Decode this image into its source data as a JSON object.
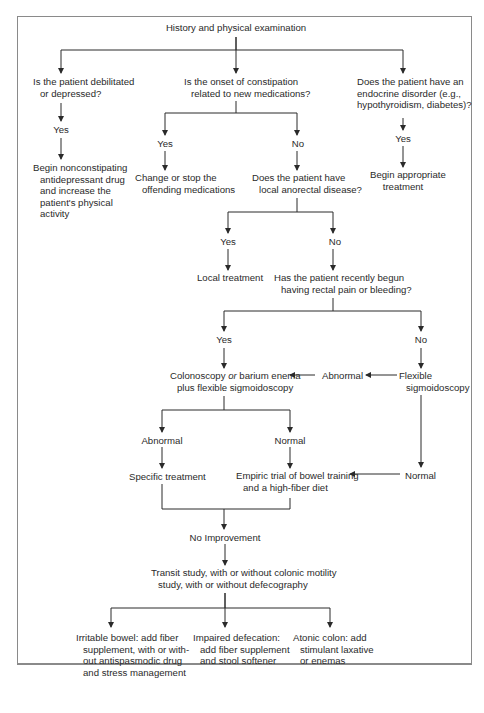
{
  "diagram": {
    "nodes": {
      "root": [
        "History and physical examination"
      ],
      "q_debilitated": [
        "Is the patient debilitated",
        "or depressed?"
      ],
      "yes_debilitated": [
        "Yes"
      ],
      "a_debilitated": [
        "Begin nonconstipating",
        "antidepressant drug",
        "and increase the",
        "patient's physical",
        "activity"
      ],
      "q_medications": [
        "Is the onset of constipation",
        "related to new medications?"
      ],
      "yes_medications": [
        "Yes"
      ],
      "no_medications": [
        "No"
      ],
      "a_medications": [
        "Change or stop the",
        "offending medications"
      ],
      "q_endocrine": [
        "Does the patient have an",
        "endocrine disorder (e.g.,",
        "hypothyroidism, diabetes)?"
      ],
      "yes_endocrine": [
        "Yes"
      ],
      "a_endocrine": [
        "Begin appropriate",
        "treatment"
      ],
      "q_anorectal": [
        "Does the patient have",
        "local anorectal disease?"
      ],
      "yes_anorectal": [
        "Yes"
      ],
      "no_anorectal": [
        "No"
      ],
      "a_anorectal": [
        "Local treatment"
      ],
      "q_rectal": [
        "Has the patient recently begun",
        "having rectal pain or bleeding?"
      ],
      "yes_rectal": [
        "Yes"
      ],
      "no_rectal": [
        "No"
      ],
      "colonoscopy": [
        "Colonoscopy or barium enema",
        "plus flexible sigmoidoscopy"
      ],
      "abnormal_flex": [
        "Abnormal"
      ],
      "flex_sig": [
        "Flexible",
        "sigmoidoscopy"
      ],
      "abnormal_colo": [
        "Abnormal"
      ],
      "normal_colo": [
        "Normal"
      ],
      "specific_tx": [
        "Specific treatment"
      ],
      "empiric": [
        "Empiric trial of bowel training",
        "and a high-fiber diet"
      ],
      "normal_flex": [
        "Normal"
      ],
      "no_improvement": [
        "No Improvement"
      ],
      "transit": [
        "Transit study, with or without colonic motility",
        "study, with or without defecography"
      ],
      "ibs": [
        "Irritable bowel: add fiber",
        "supplement, with or with-",
        "out antispasmodic drug",
        "and stress management"
      ],
      "impaired": [
        "Impaired defecation:",
        "add fiber supplement",
        "and stool softener"
      ],
      "atonic": [
        "Atonic colon: add",
        "stimulant laxative",
        "or enemas"
      ]
    },
    "colonoscopy_or_emphasis": "or"
  }
}
